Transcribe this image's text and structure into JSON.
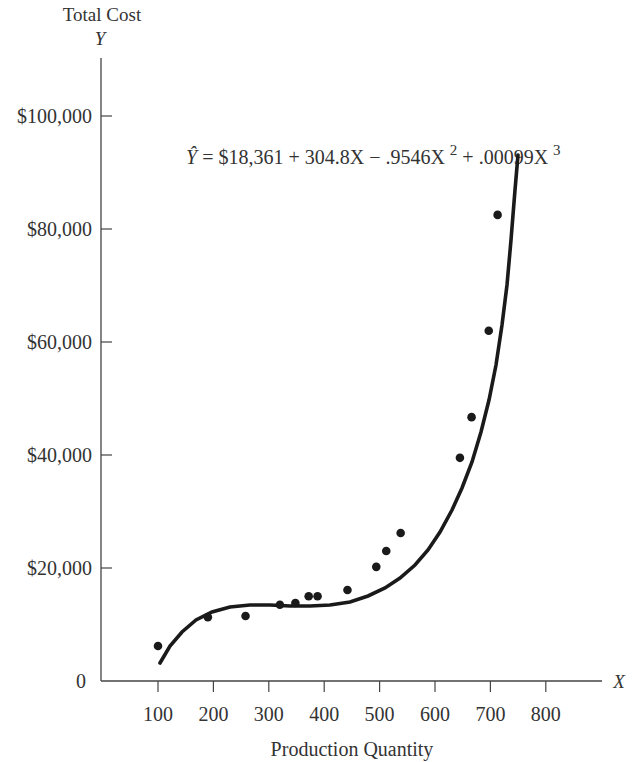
{
  "chart_data": {
    "type": "scatter",
    "title": "",
    "ylabel": "Total Cost",
    "ysymbol": "Y",
    "xlabel": "Production Quantity",
    "xsymbol": "X",
    "equation": {
      "lhs": "Ŷ",
      "text": "= $18,361 +  304.8X − .9546X",
      "exp2": "2",
      "mid": " + .00099X",
      "exp3": "3",
      "coefficients": {
        "b0": 18361,
        "b1": 304.8,
        "b2": -0.9546,
        "b3": 0.00099
      }
    },
    "x_ticks": [
      100,
      200,
      300,
      400,
      500,
      600,
      700,
      800
    ],
    "x_tick_labels": [
      "100",
      "200",
      "300",
      "400",
      "500",
      "600",
      "700",
      "800"
    ],
    "y_ticks": [
      0,
      20000,
      40000,
      60000,
      80000,
      100000
    ],
    "y_tick_labels": [
      "0",
      "$20,000",
      "$40,000",
      "$60,000",
      "$80,000",
      "$100,000"
    ],
    "xlim": [
      0,
      850
    ],
    "ylim": [
      0,
      110000
    ],
    "grid": false,
    "legend": "none",
    "points": [
      {
        "x": 100,
        "y": 6200
      },
      {
        "x": 190,
        "y": 11300
      },
      {
        "x": 258,
        "y": 11500
      },
      {
        "x": 320,
        "y": 13500
      },
      {
        "x": 348,
        "y": 13800
      },
      {
        "x": 372,
        "y": 15000
      },
      {
        "x": 388,
        "y": 15000
      },
      {
        "x": 442,
        "y": 16100
      },
      {
        "x": 494,
        "y": 20200
      },
      {
        "x": 512,
        "y": 23000
      },
      {
        "x": 538,
        "y": 26200
      },
      {
        "x": 645,
        "y": 39500
      },
      {
        "x": 666,
        "y": 46700
      },
      {
        "x": 697,
        "y": 62000
      },
      {
        "x": 713,
        "y": 82500
      }
    ],
    "fit_curve_range": [
      105,
      735
    ]
  }
}
